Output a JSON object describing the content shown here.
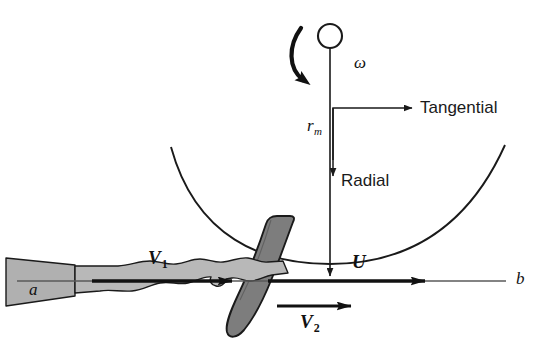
{
  "figure": {
    "background_color": "#ffffff"
  },
  "colors": {
    "stroke": "#1a1a1a",
    "bucket_fill": "#7d7d7d",
    "jet_fill": "#b8b8b8",
    "nozzle_fill": "#b0b0b0",
    "centerline": "#555555",
    "text": "#111111"
  },
  "labels": {
    "omega": "ω",
    "radius": {
      "base": "r",
      "sub": "m"
    },
    "tangential": "Tangential",
    "radial": "Radial",
    "jet_inlet_velocity": {
      "base": "V",
      "sub": "1"
    },
    "jet_exit_velocity": {
      "base": "V",
      "sub": "2"
    },
    "blade_velocity": "U",
    "point_a": "a",
    "point_b": "b"
  },
  "geometry": {
    "wheel_center_x": 330,
    "wheel_rim_y": 262,
    "centerline_y": 281,
    "shaft_circle": {
      "cx": 330,
      "cy": 36,
      "r": 12
    }
  }
}
